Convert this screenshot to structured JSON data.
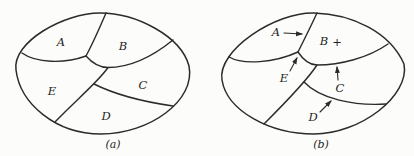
{
  "colors": {
    "background": "#fcfcfa",
    "stroke": "#2b2b2b",
    "text": "#1f1f1f"
  },
  "diagram_a": {
    "caption": "(a)",
    "regions": {
      "A": "A",
      "B": "B",
      "C": "C",
      "D": "D",
      "E": "E"
    }
  },
  "diagram_b": {
    "caption": "(b)",
    "plus_marker": "+",
    "regions": {
      "A": "A",
      "B": "B",
      "C": "C",
      "D": "D",
      "E": "E"
    }
  }
}
